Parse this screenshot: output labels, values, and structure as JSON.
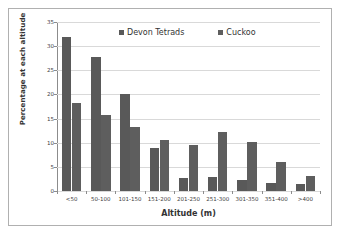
{
  "chart_data": {
    "type": "bar",
    "title": "",
    "xlabel": "Altitude (m)",
    "ylabel": "Percentage at each altitude",
    "categories": [
      "<50",
      "50-100",
      "101-150",
      "151-200",
      "201-250",
      "251-300",
      "301-350",
      "351-400",
      ">400"
    ],
    "series": [
      {
        "name": "Devon Tetrads",
        "color": "#595959",
        "values": [
          32.0,
          27.7,
          20.0,
          8.9,
          2.7,
          2.8,
          2.2,
          1.7,
          1.5
        ]
      },
      {
        "name": "Cuckoo",
        "color": "#5e5e5e",
        "values": [
          18.3,
          15.8,
          13.3,
          10.6,
          9.6,
          12.2,
          10.1,
          6.0,
          3.2
        ]
      }
    ],
    "ylim": [
      0,
      35
    ],
    "yticks": [
      0,
      5,
      10,
      15,
      20,
      25,
      30,
      35
    ],
    "ytick_labels": [
      "0",
      "5",
      "10",
      "15",
      "20",
      "25",
      "30",
      "35"
    ],
    "grid": true,
    "legend_position": "top-center",
    "legend_entries": [
      "Devon Tetrads",
      "Cuckoo"
    ]
  }
}
